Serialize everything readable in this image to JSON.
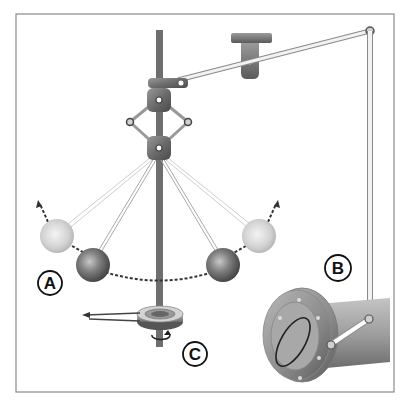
{
  "diagram": {
    "labels": {
      "A": "A",
      "B": "B",
      "C": "C"
    },
    "colors": {
      "frame": "#8a8a8a",
      "spindle": "#6e6e6e",
      "ball_dark": "#7a7a7a",
      "ball_light": "#d9d9d9",
      "dashed_path": "#333333",
      "pipe": "#9a9a9a",
      "link": "#e6e6e6"
    }
  }
}
